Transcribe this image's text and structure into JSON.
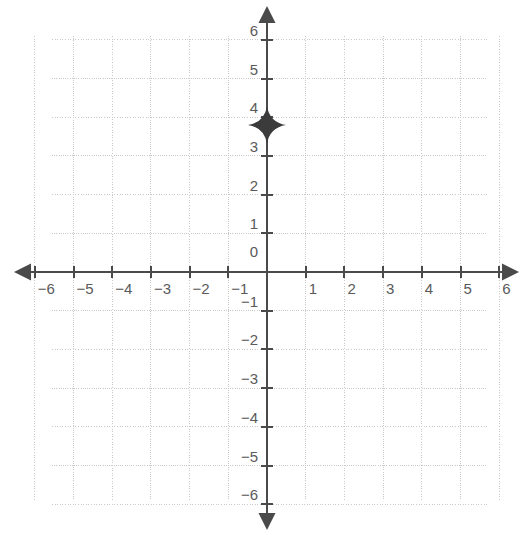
{
  "chart_data": {
    "type": "scatter",
    "title": "",
    "subtitle": "",
    "xlabel": "",
    "ylabel": "",
    "xlim": [
      -6,
      6
    ],
    "ylim": [
      -6,
      6
    ],
    "xticks": [
      -6,
      -5,
      -4,
      -3,
      -2,
      -1,
      0,
      1,
      2,
      3,
      4,
      5,
      6
    ],
    "yticks": [
      -6,
      -5,
      -4,
      -3,
      -2,
      -1,
      0,
      1,
      2,
      3,
      4,
      5,
      6
    ],
    "xtick_labels": [
      "−6",
      "−5",
      "−4",
      "−3",
      "−2",
      "−1",
      "",
      "1",
      "2",
      "3",
      "4",
      "5",
      "6"
    ],
    "ytick_labels": [
      "−6",
      "−5",
      "−4",
      "−3",
      "−2",
      "−1",
      "0",
      "1",
      "2",
      "3",
      "4",
      "5",
      "6"
    ],
    "origin_label": "0",
    "grid": true,
    "grid_style": "dotted",
    "legend": "none",
    "axis_arrows": [
      "left",
      "right",
      "up",
      "down"
    ],
    "series": [
      {
        "name": "plotted point",
        "marker": "four-pointed-star",
        "points": [
          {
            "x": 0,
            "y": 3.8,
            "label": ""
          }
        ]
      }
    ],
    "colors": {
      "background": "#ffffff",
      "grid": "#c9c9c9",
      "axis": "#4a4a4a",
      "tick_label": "#5a5a5a",
      "marker": "#3b3b3b"
    }
  },
  "geometry": {
    "origin_px": {
      "x": 267,
      "y": 272
    },
    "unit_px": 38.7,
    "grid_bounds_px": {
      "left": 52,
      "top": 36,
      "right": 488,
      "bottom": 500
    },
    "arrow_tips_px": {
      "left": 14,
      "right": 519,
      "top": 6,
      "bottom": 530
    }
  }
}
